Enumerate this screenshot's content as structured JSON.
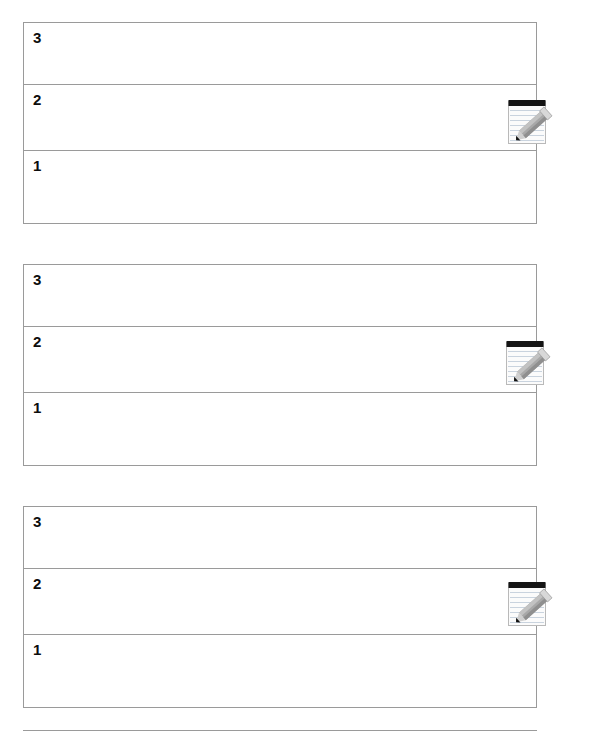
{
  "document": {
    "title": "Ranking Sheet",
    "background_color": "#ffffff",
    "border_color": "#9a9a9a",
    "text_color": "#0d0d0d"
  },
  "blocks": [
    {
      "id": "block-1",
      "rows": [
        {
          "label": "3"
        },
        {
          "label": "2"
        },
        {
          "label": "1"
        }
      ],
      "icon": {
        "name": "memo-notepad-pencil-icon",
        "glyph": "memo"
      }
    },
    {
      "id": "block-2",
      "rows": [
        {
          "label": "3"
        },
        {
          "label": "2"
        },
        {
          "label": "1"
        }
      ],
      "icon": {
        "name": "memo-notepad-pencil-icon",
        "glyph": "memo"
      }
    },
    {
      "id": "block-3",
      "rows": [
        {
          "label": "3"
        },
        {
          "label": "2"
        },
        {
          "label": "1"
        }
      ],
      "icon": {
        "name": "memo-notepad-pencil-icon",
        "glyph": "memo"
      }
    }
  ],
  "partial_block": {
    "note": "top border of a fourth table, cut off by the page edge"
  },
  "colors": {
    "notepad_body": "#fbfbfb",
    "notepad_edge": "#b8b8b8",
    "notepad_binding": "#141414",
    "notepad_rule": "#c9d3de",
    "pencil_body": "#a0a0a0",
    "pencil_body_light": "#bdbdbd",
    "pencil_ferrule": "#d6d6d6",
    "pencil_tip": "#111111"
  }
}
